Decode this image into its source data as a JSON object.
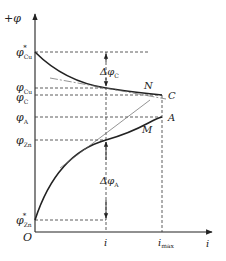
{
  "diagram": {
    "type": "polarization-curves",
    "y_axis": {
      "label": "+φ"
    },
    "x_axis": {
      "label": "i",
      "ticks": [
        "i",
        "i_max"
      ]
    },
    "origin": "O",
    "y_levels": [
      {
        "symbol": "φ",
        "sub": "Cu",
        "sup": "*"
      },
      {
        "symbol": "φ",
        "sub": "Cu",
        "sup": ""
      },
      {
        "symbol": "φ",
        "sub": "C",
        "sup": ""
      },
      {
        "symbol": "φ",
        "sub": "A",
        "sup": ""
      },
      {
        "symbol": "φ",
        "sub": "Zn",
        "sup": ""
      },
      {
        "symbol": "φ",
        "sub": "Zn",
        "sup": "*"
      }
    ],
    "curves": [
      {
        "name": "cathode-curve",
        "point_label": "N",
        "end_label": "C"
      },
      {
        "name": "anode-curve",
        "point_label": "M",
        "end_label": "A"
      }
    ],
    "deltas": [
      {
        "symbol": "Δφ",
        "sub": "C"
      },
      {
        "symbol": "Δφ",
        "sub": "A"
      }
    ],
    "colors": {
      "line": "#222222",
      "dash": "#333333",
      "tangent": "#666666"
    }
  }
}
